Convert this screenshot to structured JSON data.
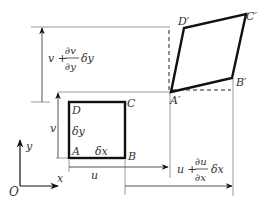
{
  "diagram": {
    "type": "deformation of a 2D element",
    "original_element": {
      "vertices": {
        "A": "A",
        "B": "B",
        "C": "C",
        "D": "D"
      },
      "side_labels": {
        "horizontal": "δx",
        "vertical": "δy"
      }
    },
    "deformed_element": {
      "vertices": {
        "A": "A′",
        "B": "B′",
        "C": "C′",
        "D": "D′"
      }
    },
    "dimensions": {
      "u": "u",
      "v": "v",
      "u_plus": {
        "base": "u +",
        "num": "∂u",
        "den": "∂x",
        "tail": "δx"
      },
      "v_plus": {
        "base": "v +",
        "num": "∂v",
        "den": "∂y",
        "tail": "δy"
      }
    },
    "axes": {
      "origin": "O",
      "x": "x",
      "y": "y"
    },
    "colors": {
      "thick_line": "#111111",
      "thin_line": "#9a9a9a",
      "text": "#333333"
    }
  }
}
